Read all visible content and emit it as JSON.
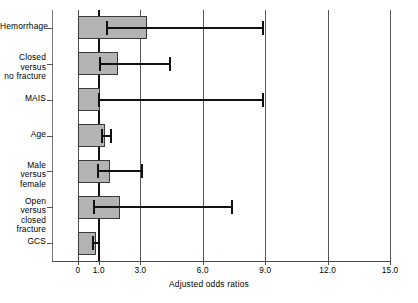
{
  "chart_data": {
    "type": "bar",
    "orientation": "horizontal",
    "title": "",
    "xlabel": "Adjusted odds ratios",
    "ylabel": "",
    "xlim": [
      0,
      15
    ],
    "grid": true,
    "legend": null,
    "reference_line": 1.0,
    "xticks": [
      0,
      1.0,
      3.0,
      6.0,
      9.0,
      12.0,
      15.0
    ],
    "xtick_labels": [
      "0",
      "1.0",
      "3.0",
      "6.0",
      "9.0",
      "12.0",
      "15.0"
    ],
    "categories": [
      "Hemorrhage",
      "Closed versus\nno fracture",
      "MAIS",
      "Age",
      "Male versus\nfemale",
      "Open versus\nclosed fracture",
      "GCS"
    ],
    "values": [
      3.3,
      1.9,
      1.05,
      1.3,
      1.55,
      2.0,
      0.85
    ],
    "error_low": [
      1.4,
      1.05,
      1.0,
      1.15,
      0.95,
      0.75,
      0.7
    ],
    "error_high": [
      8.9,
      4.4,
      8.9,
      1.6,
      3.1,
      7.4,
      1.0
    ],
    "bar_color": "#b3b3b3",
    "bar_edge_color": "#3a3a3a",
    "error_color": "#111111"
  },
  "axis": {
    "x_title": "Adjusted odds ratios"
  }
}
